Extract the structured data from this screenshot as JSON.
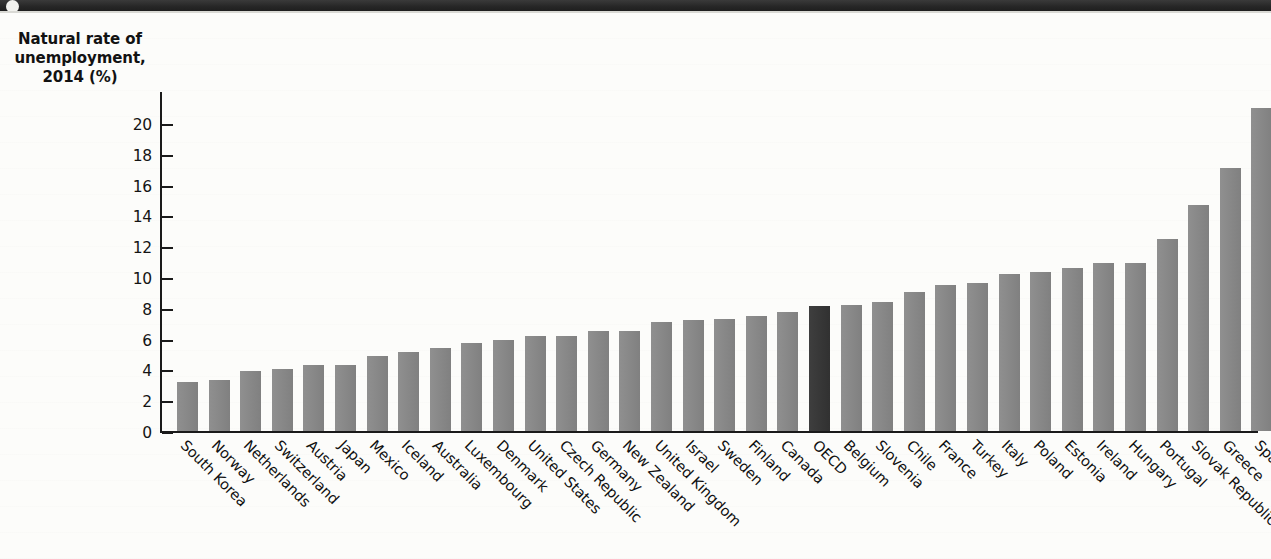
{
  "header": {
    "band_label": "",
    "icon": "circle-bullet-icon"
  },
  "axis": {
    "y_title_line1": "Natural rate of",
    "y_title_line2": "unemployment,",
    "y_title_line3": "2014 (%)",
    "y_ticks": [
      "0",
      "2",
      "4",
      "6",
      "8",
      "10",
      "12",
      "14",
      "16",
      "18",
      "20"
    ]
  },
  "colors": {
    "bar": "#878787",
    "highlight_bar": "#343434",
    "axis": "#1a1a1a",
    "header_band": "#2b2b2b",
    "page": "#fcfcfa"
  },
  "chart_data": {
    "type": "bar",
    "title": "Natural rate of unemployment, 2014 (%)",
    "xlabel": "",
    "ylabel": "Natural rate of unemployment, 2014 (%)",
    "ylim": [
      0,
      21.5
    ],
    "ytick_step": 2,
    "grid": false,
    "legend": "none",
    "highlight_category": "OECD",
    "categories": [
      "South Korea",
      "Norway",
      "Netherlands",
      "Switzerland",
      "Austria",
      "Japan",
      "Mexico",
      "Iceland",
      "Australia",
      "Luxembourg",
      "Denmark",
      "United States",
      "Czech Republic",
      "Germany",
      "New Zealand",
      "United Kingdom",
      "Israel",
      "Sweden",
      "Finland",
      "Canada",
      "OECD",
      "Belgium",
      "Slovenia",
      "Chile",
      "France",
      "Turkey",
      "Italy",
      "Poland",
      "Estonia",
      "Ireland",
      "Hungary",
      "Portugal",
      "Slovak Republic",
      "Greece",
      "Spain"
    ],
    "values": [
      3.2,
      3.3,
      3.9,
      4.0,
      4.3,
      4.3,
      4.9,
      5.1,
      5.4,
      5.7,
      5.9,
      6.2,
      6.2,
      6.5,
      6.5,
      7.1,
      7.2,
      7.3,
      7.5,
      7.7,
      8.1,
      8.2,
      8.4,
      9.0,
      9.5,
      9.6,
      10.2,
      10.3,
      10.6,
      10.9,
      10.9,
      12.5,
      14.7,
      17.1,
      21.0
    ]
  }
}
